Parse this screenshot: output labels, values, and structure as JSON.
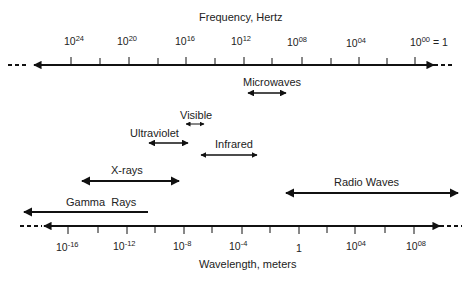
{
  "frequency_axis": {
    "title": "Frequency, Hertz",
    "labels": [
      {
        "base": "10",
        "exp": "24",
        "suffix": ""
      },
      {
        "base": "10",
        "exp": "20",
        "suffix": ""
      },
      {
        "base": "10",
        "exp": "16",
        "suffix": ""
      },
      {
        "base": "10",
        "exp": "12",
        "suffix": ""
      },
      {
        "base": "10",
        "exp": "08",
        "suffix": ""
      },
      {
        "base": "10",
        "exp": "04",
        "suffix": ""
      },
      {
        "base": "10",
        "exp": "00",
        "suffix": " = 1"
      }
    ]
  },
  "wavelength_axis": {
    "title": "Wavelength, meters",
    "labels": [
      {
        "base": "10",
        "exp": "-16"
      },
      {
        "base": "10",
        "exp": "-12"
      },
      {
        "base": "10",
        "exp": "-8"
      },
      {
        "base": "10",
        "exp": "-4"
      },
      {
        "base": "1",
        "exp": ""
      },
      {
        "base": "10",
        "exp": "04"
      },
      {
        "base": "10",
        "exp": "08"
      }
    ]
  },
  "bands": [
    {
      "name": "Microwaves"
    },
    {
      "name": "Visible"
    },
    {
      "name": "Ultraviolet"
    },
    {
      "name": "Infrared"
    },
    {
      "name": "X-rays"
    },
    {
      "name": "Radio Waves"
    },
    {
      "name": "Gamma  Rays"
    }
  ],
  "colors": {
    "line": "#111111",
    "text": "#222222",
    "background": "#ffffff"
  }
}
